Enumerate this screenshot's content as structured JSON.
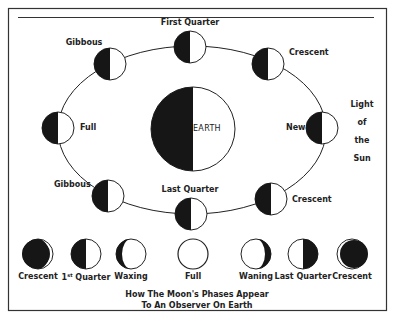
{
  "colors": {
    "ink": "#161616",
    "paper": "#ffffff",
    "text": "#222222"
  },
  "orbit": {
    "positions": [
      {
        "label": "First Quarter",
        "position": "top"
      },
      {
        "label": "Gibbous",
        "position": "upper-left"
      },
      {
        "label": "Crescent",
        "position": "upper-right"
      },
      {
        "label": "Full",
        "position": "left"
      },
      {
        "label": "New",
        "position": "right"
      },
      {
        "label": "Gibbous",
        "position": "lower-left"
      },
      {
        "label": "Crescent",
        "position": "lower-right"
      },
      {
        "label": "Last Quarter",
        "position": "bottom"
      }
    ]
  },
  "earth": {
    "label": "EARTH"
  },
  "sun": {
    "lines": [
      "Light",
      "of",
      "the",
      "Sun"
    ]
  },
  "observer_row": {
    "phases": [
      {
        "label": "Crescent",
        "appearance": "waxing-crescent-thin-lit-right"
      },
      {
        "label_main": "1",
        "label_sup": "st",
        "label_rest": " Quarter",
        "appearance": "half-lit-right"
      },
      {
        "label": "Waxing",
        "appearance": "gibbous-dark-sliver-left"
      },
      {
        "label": "Full",
        "appearance": "full-lit"
      },
      {
        "label": "Waning",
        "appearance": "gibbous-dark-sliver-right"
      },
      {
        "label": "Last Quarter",
        "appearance": "half-lit-left"
      },
      {
        "label": "Crescent",
        "appearance": "crescent-thin-lit-left"
      }
    ]
  },
  "caption": {
    "line1": "How The Moon's Phases Appear",
    "line2": "To An Observer On Earth"
  }
}
